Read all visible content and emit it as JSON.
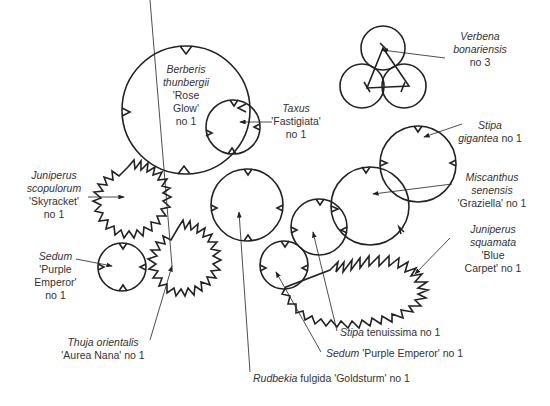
{
  "diagram": {
    "type": "planting-plan",
    "line_color": "#222222",
    "text_color": "#333333"
  },
  "plants": [
    {
      "id": "berberis",
      "genus": "Berberis",
      "species": "thunbergii",
      "cultivar": "'Rose",
      "cultivar2": "Glow'",
      "qty": "no 1"
    },
    {
      "id": "taxus",
      "genus": "Taxus",
      "cultivar": "'Fastigiata'",
      "qty": "no 1"
    },
    {
      "id": "verbena",
      "genus": "Verbena",
      "species": "bonariensis",
      "qty": "no 3"
    },
    {
      "id": "stipa-gigantea",
      "genus": "Stipa",
      "species": "gigantea",
      "qty": "no 1"
    },
    {
      "id": "miscanthus",
      "genus": "Miscanthus",
      "species": "senensis",
      "cultivar": "'Graziella'",
      "qty": "no 1"
    },
    {
      "id": "juniperus-squamata",
      "genus": "Juniperus",
      "species": "squamata",
      "cultivar": "'Blue",
      "cultivar2": "Carpet'",
      "qty": "no 1"
    },
    {
      "id": "juniperus-scopulorum",
      "genus": "Juniperus",
      "species": "scopulorum",
      "cultivar": "'Skyracket'",
      "qty": "no 1"
    },
    {
      "id": "sedum-left",
      "genus": "Sedum",
      "cultivar": "'Purple",
      "cultivar2": "Emperor'",
      "qty": "no 1"
    },
    {
      "id": "thuja",
      "genus": "Thuja orientalis",
      "cultivar": "'Aurea Nana'",
      "qty": "no 1"
    },
    {
      "id": "stipa-tenuissima",
      "genus": "Stipa",
      "rest": "tenuissima no 1"
    },
    {
      "id": "sedum-bottom",
      "genus": "Sedum",
      "rest": "'Purple Emperor' no 1"
    },
    {
      "id": "rudbekia",
      "genus": "Rudbekia",
      "rest": "fulgida 'Goldsturm' no 1"
    }
  ]
}
